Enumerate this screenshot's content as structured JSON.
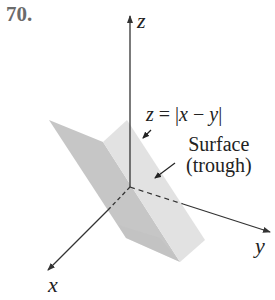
{
  "exercise": {
    "number": "70."
  },
  "axes": {
    "z_label": "z",
    "x_label": "x",
    "y_label": "y"
  },
  "annotations": {
    "equation_lhs": "z",
    "equation_eq": " = |",
    "equation_x": "x",
    "equation_minus": " − ",
    "equation_y": "y",
    "equation_close": "|",
    "surface_line1": "Surface",
    "surface_line2": "(trough)"
  },
  "colors": {
    "face_dark": "#c9c9c9",
    "face_light": "#e3e3e3",
    "axis": "#333333"
  }
}
